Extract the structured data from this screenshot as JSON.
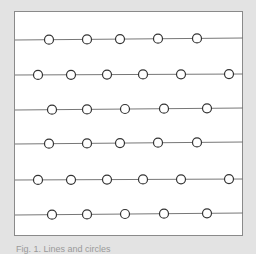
{
  "figure": {
    "caption": "Fig. 1. Lines and circles",
    "colors": {
      "background": "#e3e3e3",
      "panel": "#ffffff",
      "panel_border": "#8a8a8a",
      "line": "#777777",
      "circle_stroke": "#333333",
      "circle_fill": "#ffffff"
    },
    "line_x_range": [
      15,
      243
    ],
    "circle_radius": 4.5,
    "rows": [
      {
        "y": 40,
        "y_end": 38,
        "circles": [
          49,
          87,
          120,
          158,
          197
        ]
      },
      {
        "y": 75,
        "y_end": 74,
        "circles": [
          38,
          71,
          107,
          143,
          181,
          229
        ]
      },
      {
        "y": 110,
        "y_end": 108,
        "circles": [
          52,
          87,
          125,
          164,
          207
        ]
      },
      {
        "y": 144,
        "y_end": 142,
        "circles": [
          49,
          87,
          120,
          158,
          197
        ]
      },
      {
        "y": 180,
        "y_end": 179,
        "circles": [
          38,
          71,
          107,
          143,
          181,
          229
        ]
      },
      {
        "y": 215,
        "y_end": 213,
        "circles": [
          52,
          87,
          125,
          164,
          207
        ]
      }
    ]
  }
}
